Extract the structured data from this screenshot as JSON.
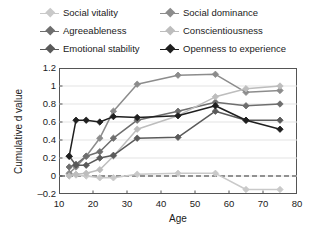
{
  "chart_data": {
    "type": "line",
    "title": "",
    "xlabel": "Age",
    "ylabel": "Cumulative d value",
    "xlim": [
      10,
      80
    ],
    "ylim": [
      -0.2,
      1.2
    ],
    "xticks": [
      10,
      20,
      30,
      40,
      50,
      60,
      70,
      80
    ],
    "yticks": [
      -0.2,
      0,
      0.2,
      0.4,
      0.6,
      0.8,
      1,
      1.2
    ],
    "ytick_labels": [
      "–0.2",
      "0",
      "0.2",
      "0.4",
      "0.6",
      "0.8",
      "1",
      "1.2"
    ],
    "xtick_labels": [
      "10",
      "20",
      "30",
      "40",
      "50",
      "60",
      "70",
      "80"
    ],
    "grid": "horizontal",
    "legend_position": "top",
    "reference_line": {
      "y": 0,
      "style": "dashed"
    },
    "marker": "diamond",
    "series": [
      {
        "name": "Social vitality",
        "color": "#c9c9c9",
        "x": [
          13,
          15,
          18,
          22,
          26,
          33,
          45,
          56,
          65,
          75
        ],
        "y": [
          0.02,
          0.01,
          0.0,
          -0.02,
          -0.02,
          0.02,
          0.03,
          0.03,
          -0.15,
          -0.15
        ]
      },
      {
        "name": "Social dominance",
        "color": "#8c8c8c",
        "x": [
          13,
          15,
          18,
          22,
          26,
          33,
          45,
          56,
          65,
          75
        ],
        "y": [
          0.03,
          0.1,
          0.22,
          0.42,
          0.72,
          1.02,
          1.12,
          1.13,
          0.93,
          0.95
        ]
      },
      {
        "name": "Agreeableness",
        "color": "#6e6e6e",
        "x": [
          13,
          15,
          18,
          22,
          26,
          33,
          45,
          56,
          65,
          75
        ],
        "y": [
          0.1,
          0.13,
          0.22,
          0.27,
          0.42,
          0.62,
          0.72,
          0.82,
          0.78,
          0.8
        ]
      },
      {
        "name": "Conscientiousness",
        "color": "#bdbdbd",
        "x": [
          13,
          15,
          18,
          22,
          26,
          33,
          45,
          56,
          65,
          75
        ],
        "y": [
          0.0,
          0.02,
          0.03,
          0.07,
          0.22,
          0.52,
          0.67,
          0.88,
          0.97,
          1.0
        ]
      },
      {
        "name": "Emotional stability",
        "color": "#5a5a5a",
        "x": [
          13,
          15,
          18,
          22,
          26,
          33,
          45,
          56,
          65,
          75
        ],
        "y": [
          0.22,
          0.12,
          0.12,
          0.2,
          0.23,
          0.42,
          0.43,
          0.72,
          0.62,
          0.62
        ]
      },
      {
        "name": "Openness to experience",
        "color": "#1f1f1f",
        "x": [
          13,
          15,
          18,
          22,
          26,
          33,
          45,
          56,
          65,
          75
        ],
        "y": [
          0.22,
          0.62,
          0.62,
          0.6,
          0.66,
          0.65,
          0.67,
          0.78,
          0.62,
          0.52
        ]
      }
    ]
  },
  "legend": {
    "items": [
      {
        "label": "Social vitality",
        "color": "#c9c9c9"
      },
      {
        "label": "Social dominance",
        "color": "#8c8c8c"
      },
      {
        "label": "Agreeableness",
        "color": "#6e6e6e"
      },
      {
        "label": "Conscientiousness",
        "color": "#bdbdbd"
      },
      {
        "label": "Emotional stability",
        "color": "#5a5a5a"
      },
      {
        "label": "Openness to experience",
        "color": "#1f1f1f"
      }
    ]
  }
}
